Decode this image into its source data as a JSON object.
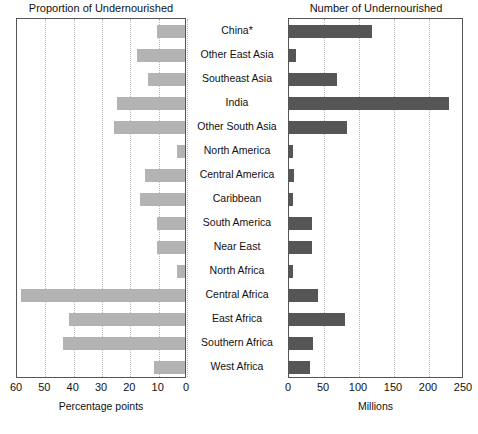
{
  "chart_data": {
    "type": "bar",
    "orientation": "horizontal",
    "layout": "paired-butterfly-two-panels",
    "categories": [
      "China*",
      "Other East Asia",
      "Southeast Asia",
      "India",
      "Other South Asia",
      "North America",
      "Central America",
      "Caribbean",
      "South America",
      "Near East",
      "North Africa",
      "Central Africa",
      "East Africa",
      "Southern Africa",
      "West Africa"
    ],
    "panels": [
      {
        "title": "Proportion of Undernourished",
        "xlabel": "Percentage points",
        "direction": "right-to-left",
        "xlim": [
          60,
          0
        ],
        "xticks": [
          60,
          50,
          40,
          30,
          20,
          10,
          0
        ],
        "grid": true,
        "bar_color": "#b3b3b3",
        "values": [
          10,
          17,
          13,
          24,
          25,
          3,
          14,
          16,
          10,
          10,
          3,
          58,
          41,
          43,
          11
        ]
      },
      {
        "title": "Number of Undernourished",
        "xlabel": "Millions",
        "direction": "left-to-right",
        "xlim": [
          0,
          250
        ],
        "xticks": [
          0,
          50,
          100,
          150,
          200,
          250
        ],
        "grid": true,
        "bar_color": "#565656",
        "values": [
          119,
          10,
          68,
          228,
          83,
          5,
          7,
          6,
          33,
          33,
          5,
          42,
          80,
          34,
          30
        ]
      }
    ]
  },
  "axis": {
    "left_ticks": [
      "60",
      "50",
      "40",
      "30",
      "20",
      "10",
      "0"
    ],
    "right_ticks": [
      "0",
      "50",
      "100",
      "150",
      "200",
      "250"
    ],
    "left_xlabel": "Percentage points",
    "right_xlabel": "Millions"
  },
  "titles": {
    "left": "Proportion of Undernourished",
    "right": "Number of Undernourished"
  }
}
